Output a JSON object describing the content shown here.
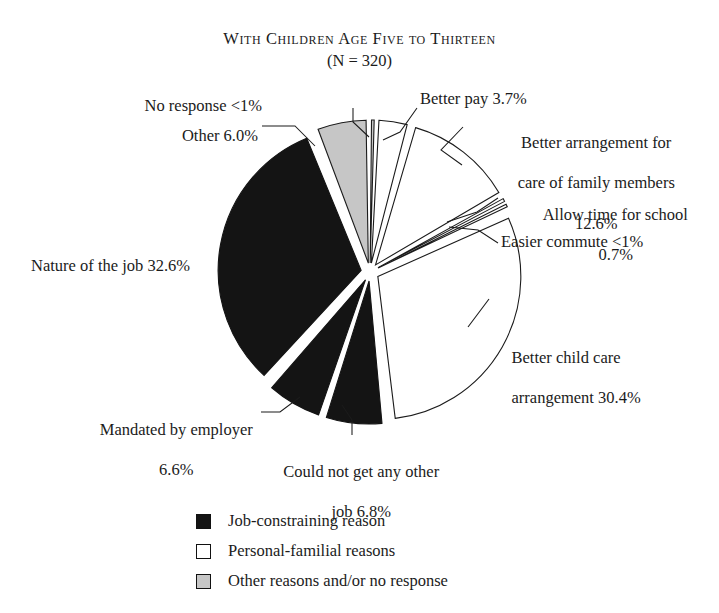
{
  "title": {
    "main": "With Children Age Five to Thirteen",
    "subtitle": "(N = 320)"
  },
  "chart_data": {
    "type": "pie",
    "title": "With Children Age Five to Thirteen",
    "subtitle": "(N = 320)",
    "n": 320,
    "units": "percent",
    "start_angle_deg": 0,
    "direction": "clockwise",
    "exploded": true,
    "legend_position": "bottom",
    "grid": false,
    "categories": [
      "No response",
      "Better pay",
      "Better arrangement for care of family members",
      "Allow time for school",
      "Easier commute",
      "Better child care arrangement",
      "Could not get any other job",
      "Mandated by employer",
      "Nature of the job",
      "Other"
    ],
    "values": [
      0.6,
      3.7,
      12.6,
      0.7,
      0.6,
      30.4,
      6.8,
      6.6,
      32.6,
      6.0
    ],
    "value_labels": [
      "<1%",
      "3.7%",
      "12.6%",
      "0.7%",
      "<1%",
      "30.4%",
      "6.8%",
      "6.6%",
      "32.6%",
      "6.0%"
    ],
    "group_of_slice": [
      "other",
      "personal-familial",
      "personal-familial",
      "personal-familial",
      "personal-familial",
      "personal-familial",
      "job-constraining",
      "job-constraining",
      "job-constraining",
      "other"
    ],
    "colors": {
      "job-constraining": "#141414",
      "personal-familial": "#ffffff",
      "other": "#c6c6c6",
      "stroke": "#1b1b1b"
    }
  },
  "slices": [
    {
      "key": "no-response",
      "label": "No response <1%",
      "percent_label": "<1%",
      "value": 0.6,
      "group": "other"
    },
    {
      "key": "better-pay",
      "label": "Better pay 3.7%",
      "percent_label": "3.7%",
      "value": 3.7,
      "group": "personal-familial"
    },
    {
      "key": "better-arrangement-family-care",
      "label_line1": "Better arrangement for",
      "label_line2": "care of family members",
      "label_line3": "12.6%",
      "percent_label": "12.6%",
      "value": 12.6,
      "group": "personal-familial"
    },
    {
      "key": "allow-time-for-school",
      "label_line1": "Allow time for school",
      "label_line2": "0.7%",
      "percent_label": "0.7%",
      "value": 0.7,
      "group": "personal-familial"
    },
    {
      "key": "easier-commute",
      "label": "Easier commute <1%",
      "percent_label": "<1%",
      "value": 0.6,
      "group": "personal-familial"
    },
    {
      "key": "better-child-care-arrangement",
      "label_line1": "Better child care",
      "label_line2": "arrangement 30.4%",
      "percent_label": "30.4%",
      "value": 30.4,
      "group": "personal-familial"
    },
    {
      "key": "could-not-get-any-other-job",
      "label_line1": "Could not get any other",
      "label_line2": "job 6.8%",
      "percent_label": "6.8%",
      "value": 6.8,
      "group": "job-constraining"
    },
    {
      "key": "mandated-by-employer",
      "label_line1": "Mandated by employer",
      "label_line2": "6.6%",
      "percent_label": "6.6%",
      "value": 6.6,
      "group": "job-constraining"
    },
    {
      "key": "nature-of-the-job",
      "label": "Nature of the job 32.6%",
      "percent_label": "32.6%",
      "value": 32.6,
      "group": "job-constraining"
    },
    {
      "key": "other",
      "label": "Other 6.0%",
      "percent_label": "6.0%",
      "value": 6.0,
      "group": "other"
    }
  ],
  "legend": {
    "items": [
      {
        "label": "Job-constraining reason",
        "color": "#141414"
      },
      {
        "label": "Personal-familial reasons",
        "color": "#ffffff"
      },
      {
        "label": "Other reasons and/or no response",
        "color": "#c6c6c6"
      }
    ]
  }
}
